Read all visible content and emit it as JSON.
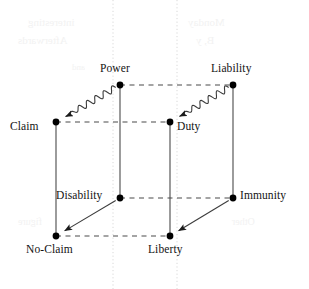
{
  "figure": {
    "width": 309,
    "height": 289,
    "background_color": "#ffffff",
    "node_color": "#000000",
    "edge_color": "#4a4a4a",
    "guide_color": "#d8d8d8",
    "node_radius": 3.4
  },
  "nodes": [
    {
      "id": "power",
      "label": "Power",
      "x": 120,
      "y": 85,
      "label_x": 100,
      "label_y": 62,
      "label_align": "left"
    },
    {
      "id": "liability",
      "label": "Liability",
      "x": 233,
      "y": 85,
      "label_x": 211,
      "label_y": 62,
      "label_align": "left"
    },
    {
      "id": "claim",
      "label": "Claim",
      "x": 56,
      "y": 122,
      "label_x": 10,
      "label_y": 120,
      "label_align": "left"
    },
    {
      "id": "duty",
      "label": "Duty",
      "x": 170,
      "y": 122,
      "label_x": 177,
      "label_y": 120,
      "label_align": "left"
    },
    {
      "id": "disability",
      "label": "Disability",
      "x": 120,
      "y": 198,
      "label_x": 56,
      "label_y": 189,
      "label_align": "left"
    },
    {
      "id": "immunity",
      "label": "Immunity",
      "x": 233,
      "y": 198,
      "label_x": 240,
      "label_y": 189,
      "label_align": "left"
    },
    {
      "id": "no-claim",
      "label": "No-Claim",
      "x": 56,
      "y": 236,
      "label_x": 26,
      "label_y": 243,
      "label_align": "left"
    },
    {
      "id": "liberty",
      "label": "Liberty",
      "x": 170,
      "y": 236,
      "label_x": 148,
      "label_y": 243,
      "label_align": "left"
    }
  ],
  "edges": {
    "dashed": [
      {
        "name": "power-to-liability",
        "from": "power",
        "to": "liability"
      },
      {
        "name": "claim-to-duty",
        "from": "claim",
        "to": "duty"
      },
      {
        "name": "disability-to-immunity",
        "from": "disability",
        "to": "immunity"
      },
      {
        "name": "no-claim-to-liberty",
        "from": "no-claim",
        "to": "liberty"
      }
    ],
    "solid": [
      {
        "name": "power-to-disability",
        "from": "power",
        "to": "disability"
      },
      {
        "name": "liability-to-immunity",
        "from": "liability",
        "to": "immunity"
      },
      {
        "name": "claim-to-no-claim",
        "from": "claim",
        "to": "no-claim"
      },
      {
        "name": "duty-to-liberty",
        "from": "duty",
        "to": "liberty"
      }
    ],
    "wavy_arrows": [
      {
        "name": "power-to-claim-wavy",
        "from": "power",
        "to": "claim"
      },
      {
        "name": "liability-to-duty-wavy",
        "from": "liability",
        "to": "duty"
      }
    ],
    "straight_arrows": [
      {
        "name": "disability-to-no-claim-arrow",
        "from": "disability",
        "to": "no-claim"
      },
      {
        "name": "immunity-to-liberty-arrow",
        "from": "immunity",
        "to": "liberty"
      }
    ]
  },
  "guides": {
    "vertical_dotted": [
      {
        "name": "page-guide-left",
        "x": 113
      },
      {
        "name": "page-guide-right",
        "x": 177
      }
    ]
  },
  "bleedthrough": [
    {
      "text": "interesting",
      "x": 28,
      "y": 16,
      "size": 11
    },
    {
      "text": "Afterwards",
      "x": 18,
      "y": 34,
      "size": 11
    },
    {
      "text": "Monday",
      "x": 188,
      "y": 16,
      "size": 11
    },
    {
      "text": "B, y",
      "x": 196,
      "y": 34,
      "size": 11
    },
    {
      "text": "and",
      "x": 72,
      "y": 62,
      "size": 9
    },
    {
      "text": "Other",
      "x": 232,
      "y": 216,
      "size": 10
    },
    {
      "text": "figure",
      "x": 18,
      "y": 216,
      "size": 10
    }
  ]
}
